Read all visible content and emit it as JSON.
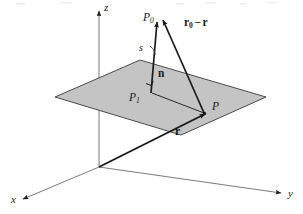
{
  "figure": {
    "background_color": "#ffffff",
    "plane_fill_color": "#c4c4c4",
    "plane_stroke_color": "#4a4a4a",
    "line_color": "#1a1a1a",
    "axes": {
      "z_label": "z",
      "x_label": "x",
      "y_label": "y"
    },
    "points": {
      "p0_label": "P",
      "p0_sub": "0",
      "p1_label": "P",
      "p1_sub": "1",
      "p_label": "P"
    },
    "vectors": {
      "normal_label": "n",
      "r_label": "r",
      "r0_minus_r_first": "r",
      "r0_minus_r_first_sub": "0",
      "r0_minus_r_operator": "−",
      "r0_minus_r_second": "r"
    },
    "distance": {
      "s_label": "s"
    }
  }
}
